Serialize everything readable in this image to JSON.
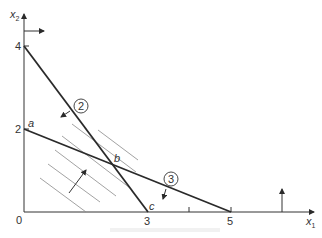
{
  "diagram": {
    "type": "linear-programming-feasible-region",
    "axes": {
      "x_label": "x",
      "x_sub": "1",
      "y_label": "x",
      "y_sub": "2",
      "origin_label": "0",
      "x_ticks": [
        "3",
        "5"
      ],
      "y_ticks": [
        "4",
        "2"
      ]
    },
    "constraints": [
      {
        "id": "2",
        "label": "2",
        "from": [
          0,
          4
        ],
        "to": [
          3,
          0
        ]
      },
      {
        "id": "3",
        "label": "3",
        "from": [
          0,
          2
        ],
        "to": [
          5,
          0
        ]
      }
    ],
    "points": [
      {
        "name": "a",
        "label": "a",
        "x": 0,
        "y": 2
      },
      {
        "name": "b",
        "label": "b",
        "x": 2.14,
        "y": 1.14
      },
      {
        "name": "c",
        "label": "c",
        "x": 3,
        "y": 0
      }
    ],
    "colors": {
      "line": "#2a2a2a",
      "hatch": "#777777",
      "text": "#333333"
    }
  }
}
